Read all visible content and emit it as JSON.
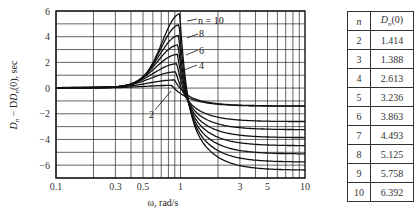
{
  "chart_data": [
    {
      "type": "line",
      "title": "",
      "xlabel": "ω, rad/s",
      "ylabel": "D_n − D_n(0), sec",
      "x_scale": "log",
      "xlim": [
        0.1,
        10
      ],
      "ylim": [
        -7,
        6
      ],
      "x_ticks": [
        "0.1",
        "0.3",
        "0.5",
        "1",
        "3",
        "5",
        "10"
      ],
      "y_ticks": [
        "6",
        "4",
        "2",
        "0",
        "−2",
        "−4",
        "−6"
      ],
      "grid": true,
      "annotations": [
        "n = 10",
        "8",
        "6",
        "4",
        "2"
      ],
      "series": [
        {
          "name": "n = 2",
          "peak_x": 0.85,
          "peak_y": 0.2,
          "asymptote_y": -1.41
        },
        {
          "name": "n = 3",
          "peak_x": 0.9,
          "peak_y": 0.6,
          "asymptote_y": -1.39
        },
        {
          "name": "n = 4",
          "peak_x": 0.92,
          "peak_y": 1.2,
          "asymptote_y": -2.61
        },
        {
          "name": "n = 5",
          "peak_x": 0.94,
          "peak_y": 1.8,
          "asymptote_y": -3.24
        },
        {
          "name": "n = 6",
          "peak_x": 0.95,
          "peak_y": 2.5,
          "asymptote_y": -3.86
        },
        {
          "name": "n = 7",
          "peak_x": 0.96,
          "peak_y": 3.2,
          "asymptote_y": -4.49
        },
        {
          "name": "n = 8",
          "peak_x": 0.97,
          "peak_y": 3.9,
          "asymptote_y": -5.13
        },
        {
          "name": "n = 9",
          "peak_x": 0.98,
          "peak_y": 4.7,
          "asymptote_y": -5.76
        },
        {
          "name": "n = 10",
          "peak_x": 0.99,
          "peak_y": 5.5,
          "asymptote_y": -6.39
        }
      ]
    },
    {
      "type": "table",
      "columns": [
        "n",
        "D_n(0)"
      ],
      "rows": [
        [
          "2",
          "1.414"
        ],
        [
          "3",
          "1.388"
        ],
        [
          "4",
          "2.613"
        ],
        [
          "5",
          "3.236"
        ],
        [
          "6",
          "3.863"
        ],
        [
          "7",
          "4.493"
        ],
        [
          "8",
          "5.125"
        ],
        [
          "9",
          "5.758"
        ],
        [
          "10",
          "6.392"
        ]
      ]
    }
  ],
  "axes": {
    "xlabel": "ω, rad/s",
    "ylabel_main": "D",
    "ylabel_sub": "n",
    "ylabel_mid": " − D",
    "ylabel_tail": "(0), sec",
    "x_ticks": [
      {
        "v": 0.1,
        "label": "0.1"
      },
      {
        "v": 0.3,
        "label": "0.3"
      },
      {
        "v": 0.5,
        "label": "0.5"
      },
      {
        "v": 1,
        "label": "1"
      },
      {
        "v": 3,
        "label": "3"
      },
      {
        "v": 5,
        "label": "5"
      },
      {
        "v": 10,
        "label": "10"
      }
    ],
    "y_ticks": [
      {
        "v": 6,
        "label": "6"
      },
      {
        "v": 4,
        "label": "4"
      },
      {
        "v": 2,
        "label": "2"
      },
      {
        "v": 0,
        "label": "0"
      },
      {
        "v": -2,
        "label": "−2"
      },
      {
        "v": -4,
        "label": "−4"
      },
      {
        "v": -6,
        "label": "−6"
      }
    ]
  },
  "labels": {
    "n10": "n = 10",
    "n8": "8",
    "n6": "6",
    "n4": "4",
    "n2": "2"
  },
  "table": {
    "header_n": "n",
    "header_val_main": "D",
    "header_val_sub": "n",
    "header_val_tail": "(0)",
    "rows": [
      {
        "n": "2",
        "v": "1.414"
      },
      {
        "n": "3",
        "v": "1.388"
      },
      {
        "n": "4",
        "v": "2.613"
      },
      {
        "n": "5",
        "v": "3.236"
      },
      {
        "n": "6",
        "v": "3.863"
      },
      {
        "n": "7",
        "v": "4.493"
      },
      {
        "n": "8",
        "v": "5.125"
      },
      {
        "n": "9",
        "v": "5.758"
      },
      {
        "n": "10",
        "v": "6.392"
      }
    ]
  }
}
